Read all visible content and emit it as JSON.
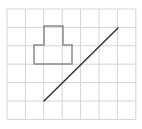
{
  "diagram": {
    "type": "grid-figure",
    "grid": {
      "columns": 7,
      "rows": 6,
      "origin_x": 7,
      "origin_y": 9,
      "cell_size": 18.4,
      "line_color": "#d4d4d4"
    },
    "shape": {
      "name": "t-shaped-polygon",
      "stroke": "#8a8a8a",
      "points": [
        [
          44,
          26
        ],
        [
          63,
          26
        ],
        [
          63,
          45
        ],
        [
          72,
          45
        ],
        [
          72,
          64
        ],
        [
          34,
          64
        ],
        [
          34,
          45
        ],
        [
          44,
          45
        ]
      ]
    },
    "segment": {
      "name": "diagonal-line",
      "stroke": "#3a3a3a",
      "from": [
        44,
        101
      ],
      "to": [
        118,
        28
      ]
    }
  }
}
